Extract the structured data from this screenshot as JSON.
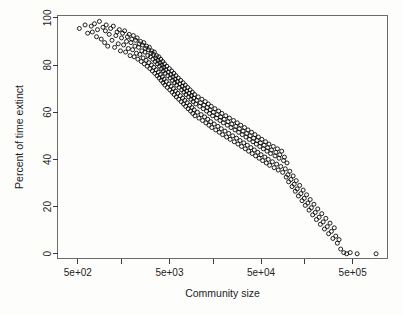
{
  "figure": {
    "background_color": "#fdfdfc",
    "point_color": "#0a0a0a",
    "axis_color": "#3a3a3a",
    "box_color": "#6b6b6b"
  },
  "chart_data": {
    "type": "scatter",
    "title": "",
    "subtitle": "",
    "xlabel": "Community size",
    "ylabel": "Percent of time extinct",
    "xscale": "log",
    "yscale": "linear",
    "xlim": [
      300,
      1200000
    ],
    "ylim": [
      -2,
      101
    ],
    "grid": false,
    "legend": null,
    "marker": "open-circle",
    "marker_size": 4,
    "x_major_ticks": [
      500,
      5000,
      50000,
      500000
    ],
    "x_major_tick_labels": [
      "5e+02",
      "5e+03",
      "5e+04",
      "5e+05"
    ],
    "x_minor_ticks": [
      1500,
      15000,
      150000,
      1500000
    ],
    "y_ticks": [
      0,
      20,
      40,
      60,
      80,
      100
    ],
    "y_tick_labels": [
      "0",
      "20",
      "40",
      "60",
      "80",
      "100"
    ],
    "n_points": 640,
    "points": [
      [
        520,
        95.5
      ],
      [
        600,
        97.0
      ],
      [
        640,
        93.5
      ],
      [
        700,
        96.5
      ],
      [
        720,
        94.0
      ],
      [
        760,
        97.5
      ],
      [
        800,
        92.0
      ],
      [
        820,
        95.0
      ],
      [
        860,
        98.5
      ],
      [
        900,
        91.0
      ],
      [
        940,
        96.0
      ],
      [
        980,
        89.5
      ],
      [
        1000,
        94.5
      ],
      [
        1020,
        97.0
      ],
      [
        1060,
        88.0
      ],
      [
        1100,
        93.0
      ],
      [
        1140,
        95.5
      ],
      [
        1180,
        90.5
      ],
      [
        1220,
        96.5
      ],
      [
        1260,
        87.5
      ],
      [
        1300,
        92.5
      ],
      [
        1340,
        94.0
      ],
      [
        1380,
        89.0
      ],
      [
        1420,
        95.0
      ],
      [
        1460,
        86.0
      ],
      [
        1500,
        91.5
      ],
      [
        1540,
        93.5
      ],
      [
        1580,
        88.5
      ],
      [
        1620,
        94.5
      ],
      [
        1660,
        85.5
      ],
      [
        1700,
        90.0
      ],
      [
        1740,
        92.0
      ],
      [
        1780,
        87.0
      ],
      [
        1820,
        93.0
      ],
      [
        1860,
        84.0
      ],
      [
        1900,
        89.5
      ],
      [
        1940,
        91.0
      ],
      [
        1980,
        86.5
      ],
      [
        2020,
        92.5
      ],
      [
        2060,
        83.5
      ],
      [
        2100,
        88.0
      ],
      [
        2140,
        90.5
      ],
      [
        2180,
        85.0
      ],
      [
        2220,
        91.5
      ],
      [
        2260,
        82.5
      ],
      [
        2300,
        87.5
      ],
      [
        2340,
        89.0
      ],
      [
        2380,
        84.5
      ],
      [
        2420,
        90.0
      ],
      [
        2460,
        81.5
      ],
      [
        2500,
        86.0
      ],
      [
        2540,
        88.5
      ],
      [
        2580,
        83.0
      ],
      [
        2620,
        89.5
      ],
      [
        2660,
        80.5
      ],
      [
        2700,
        85.5
      ],
      [
        2740,
        87.0
      ],
      [
        2780,
        82.0
      ],
      [
        2820,
        88.0
      ],
      [
        2860,
        79.5
      ],
      [
        2900,
        84.0
      ],
      [
        2940,
        86.5
      ],
      [
        2980,
        81.0
      ],
      [
        3020,
        87.5
      ],
      [
        3060,
        78.5
      ],
      [
        3100,
        83.5
      ],
      [
        3140,
        85.0
      ],
      [
        3180,
        80.0
      ],
      [
        3220,
        86.0
      ],
      [
        3260,
        77.5
      ],
      [
        3300,
        82.5
      ],
      [
        3340,
        84.5
      ],
      [
        3380,
        79.0
      ],
      [
        3420,
        85.5
      ],
      [
        3460,
        76.5
      ],
      [
        3500,
        81.5
      ],
      [
        3540,
        83.0
      ],
      [
        3580,
        78.0
      ],
      [
        3620,
        84.0
      ],
      [
        3660,
        75.5
      ],
      [
        3700,
        80.5
      ],
      [
        3740,
        82.0
      ],
      [
        3780,
        77.0
      ],
      [
        3820,
        83.5
      ],
      [
        3860,
        74.5
      ],
      [
        3900,
        79.5
      ],
      [
        3940,
        81.0
      ],
      [
        3980,
        76.0
      ],
      [
        4020,
        82.5
      ],
      [
        4060,
        73.5
      ],
      [
        4100,
        78.5
      ],
      [
        4140,
        80.0
      ],
      [
        4180,
        75.0
      ],
      [
        4220,
        81.5
      ],
      [
        4260,
        72.5
      ],
      [
        4300,
        77.5
      ],
      [
        4340,
        79.0
      ],
      [
        4380,
        74.0
      ],
      [
        4420,
        80.5
      ],
      [
        4460,
        71.5
      ],
      [
        4500,
        76.5
      ],
      [
        4560,
        78.0
      ],
      [
        4620,
        73.0
      ],
      [
        4680,
        79.5
      ],
      [
        4740,
        70.5
      ],
      [
        4800,
        75.5
      ],
      [
        4860,
        77.0
      ],
      [
        4920,
        72.0
      ],
      [
        4980,
        78.5
      ],
      [
        5040,
        69.5
      ],
      [
        5100,
        74.5
      ],
      [
        5160,
        76.0
      ],
      [
        5220,
        71.0
      ],
      [
        5280,
        77.5
      ],
      [
        5340,
        68.5
      ],
      [
        5400,
        73.5
      ],
      [
        5460,
        75.0
      ],
      [
        5520,
        70.0
      ],
      [
        5580,
        76.5
      ],
      [
        5640,
        67.5
      ],
      [
        5700,
        72.5
      ],
      [
        5760,
        74.0
      ],
      [
        5820,
        69.0
      ],
      [
        5880,
        75.5
      ],
      [
        5940,
        66.5
      ],
      [
        6000,
        71.5
      ],
      [
        6080,
        73.0
      ],
      [
        6160,
        68.0
      ],
      [
        6240,
        74.5
      ],
      [
        6320,
        65.5
      ],
      [
        6400,
        70.5
      ],
      [
        6480,
        72.0
      ],
      [
        6560,
        67.0
      ],
      [
        6640,
        73.5
      ],
      [
        6720,
        64.5
      ],
      [
        6800,
        69.5
      ],
      [
        6880,
        71.0
      ],
      [
        6960,
        66.0
      ],
      [
        7040,
        72.5
      ],
      [
        7120,
        63.5
      ],
      [
        7200,
        68.5
      ],
      [
        7280,
        70.0
      ],
      [
        7360,
        65.0
      ],
      [
        7440,
        71.5
      ],
      [
        7520,
        62.5
      ],
      [
        7600,
        67.5
      ],
      [
        7700,
        69.0
      ],
      [
        7800,
        64.0
      ],
      [
        7900,
        70.5
      ],
      [
        8000,
        61.5
      ],
      [
        8100,
        66.5
      ],
      [
        8200,
        68.0
      ],
      [
        8300,
        63.0
      ],
      [
        8400,
        69.5
      ],
      [
        8500,
        60.5
      ],
      [
        8600,
        65.5
      ],
      [
        8700,
        67.0
      ],
      [
        8800,
        62.0
      ],
      [
        8900,
        68.5
      ],
      [
        9000,
        59.5
      ],
      [
        9100,
        64.5
      ],
      [
        9200,
        66.0
      ],
      [
        9300,
        61.0
      ],
      [
        9400,
        67.5
      ],
      [
        9500,
        58.5
      ],
      [
        9700,
        63.5
      ],
      [
        9900,
        65.0
      ],
      [
        10100,
        60.0
      ],
      [
        10300,
        66.5
      ],
      [
        10500,
        57.5
      ],
      [
        10700,
        62.5
      ],
      [
        10900,
        64.0
      ],
      [
        11100,
        59.0
      ],
      [
        11300,
        65.5
      ],
      [
        11500,
        56.5
      ],
      [
        11700,
        61.5
      ],
      [
        11900,
        63.0
      ],
      [
        12100,
        58.0
      ],
      [
        12300,
        64.5
      ],
      [
        12500,
        55.5
      ],
      [
        12700,
        60.5
      ],
      [
        12900,
        62.0
      ],
      [
        13100,
        57.0
      ],
      [
        13300,
        63.5
      ],
      [
        13500,
        54.5
      ],
      [
        13700,
        59.5
      ],
      [
        13900,
        61.0
      ],
      [
        14100,
        56.0
      ],
      [
        14300,
        62.5
      ],
      [
        14500,
        53.5
      ],
      [
        14800,
        58.5
      ],
      [
        15100,
        60.0
      ],
      [
        15400,
        55.0
      ],
      [
        15700,
        61.5
      ],
      [
        16000,
        52.5
      ],
      [
        16300,
        57.5
      ],
      [
        16600,
        59.0
      ],
      [
        16900,
        54.0
      ],
      [
        17200,
        60.5
      ],
      [
        17500,
        51.5
      ],
      [
        17800,
        56.5
      ],
      [
        18100,
        58.0
      ],
      [
        18400,
        53.0
      ],
      [
        18700,
        59.5
      ],
      [
        19000,
        50.5
      ],
      [
        19400,
        55.5
      ],
      [
        19800,
        57.0
      ],
      [
        20200,
        52.0
      ],
      [
        20600,
        58.5
      ],
      [
        21000,
        49.5
      ],
      [
        21400,
        54.5
      ],
      [
        21800,
        56.0
      ],
      [
        22200,
        51.0
      ],
      [
        22600,
        57.5
      ],
      [
        23000,
        48.5
      ],
      [
        23500,
        53.5
      ],
      [
        24000,
        55.0
      ],
      [
        24500,
        50.0
      ],
      [
        25000,
        56.5
      ],
      [
        25500,
        47.5
      ],
      [
        26000,
        52.5
      ],
      [
        26500,
        54.0
      ],
      [
        27000,
        49.0
      ],
      [
        27500,
        55.5
      ],
      [
        28000,
        46.5
      ],
      [
        28500,
        51.5
      ],
      [
        29000,
        53.0
      ],
      [
        29500,
        48.0
      ],
      [
        30000,
        54.5
      ],
      [
        30600,
        45.5
      ],
      [
        31200,
        50.5
      ],
      [
        31800,
        52.0
      ],
      [
        32400,
        47.0
      ],
      [
        33000,
        53.5
      ],
      [
        33600,
        44.5
      ],
      [
        34200,
        49.5
      ],
      [
        34800,
        51.0
      ],
      [
        35400,
        46.0
      ],
      [
        36000,
        52.5
      ],
      [
        36600,
        43.5
      ],
      [
        37300,
        48.5
      ],
      [
        38000,
        50.0
      ],
      [
        38700,
        45.0
      ],
      [
        39400,
        51.5
      ],
      [
        40100,
        42.5
      ],
      [
        40800,
        47.5
      ],
      [
        41500,
        49.0
      ],
      [
        42200,
        44.0
      ],
      [
        42900,
        50.5
      ],
      [
        43600,
        41.5
      ],
      [
        44400,
        46.5
      ],
      [
        45200,
        48.0
      ],
      [
        46000,
        43.0
      ],
      [
        46800,
        49.5
      ],
      [
        47600,
        40.5
      ],
      [
        48400,
        45.5
      ],
      [
        49200,
        47.0
      ],
      [
        50000,
        42.0
      ],
      [
        51000,
        48.5
      ],
      [
        52000,
        39.5
      ],
      [
        53000,
        44.5
      ],
      [
        54000,
        46.0
      ],
      [
        55000,
        41.0
      ],
      [
        56000,
        47.5
      ],
      [
        57000,
        38.5
      ],
      [
        58000,
        43.5
      ],
      [
        59000,
        45.0
      ],
      [
        60000,
        40.0
      ],
      [
        61000,
        46.5
      ],
      [
        62000,
        37.5
      ],
      [
        63500,
        42.5
      ],
      [
        65000,
        44.0
      ],
      [
        66500,
        39.0
      ],
      [
        68000,
        45.5
      ],
      [
        69500,
        36.5
      ],
      [
        71000,
        41.5
      ],
      [
        72500,
        43.0
      ],
      [
        74000,
        38.0
      ],
      [
        75500,
        44.5
      ],
      [
        77000,
        35.5
      ],
      [
        78500,
        40.5
      ],
      [
        80000,
        42.0
      ],
      [
        82000,
        37.0
      ],
      [
        84000,
        43.5
      ],
      [
        86000,
        34.5
      ],
      [
        88000,
        39.5
      ],
      [
        90000,
        41.0
      ],
      [
        92000,
        36.0
      ],
      [
        94000,
        32.5
      ],
      [
        96000,
        38.5
      ],
      [
        98000,
        33.5
      ],
      [
        100000,
        30.5
      ],
      [
        103000,
        35.0
      ],
      [
        106000,
        31.5
      ],
      [
        109000,
        28.5
      ],
      [
        112000,
        33.0
      ],
      [
        115000,
        29.5
      ],
      [
        118000,
        26.5
      ],
      [
        121000,
        31.0
      ],
      [
        124000,
        27.5
      ],
      [
        128000,
        24.5
      ],
      [
        132000,
        29.0
      ],
      [
        136000,
        25.5
      ],
      [
        140000,
        22.5
      ],
      [
        144000,
        27.0
      ],
      [
        148000,
        23.5
      ],
      [
        152000,
        20.5
      ],
      [
        157000,
        25.0
      ],
      [
        162000,
        21.5
      ],
      [
        167000,
        18.5
      ],
      [
        172000,
        23.0
      ],
      [
        177000,
        19.5
      ],
      [
        183000,
        16.5
      ],
      [
        189000,
        21.0
      ],
      [
        195000,
        17.5
      ],
      [
        201000,
        14.5
      ],
      [
        208000,
        19.0
      ],
      [
        215000,
        15.5
      ],
      [
        222000,
        12.5
      ],
      [
        230000,
        17.0
      ],
      [
        238000,
        13.5
      ],
      [
        246000,
        10.5
      ],
      [
        255000,
        15.0
      ],
      [
        264000,
        11.5
      ],
      [
        273000,
        8.5
      ],
      [
        283000,
        13.0
      ],
      [
        293000,
        9.5
      ],
      [
        304000,
        6.5
      ],
      [
        315000,
        11.0
      ],
      [
        327000,
        7.5
      ],
      [
        340000,
        4.5
      ],
      [
        355000,
        6.0
      ],
      [
        370000,
        2.0
      ],
      [
        400000,
        0.5
      ],
      [
        430000,
        0.0
      ],
      [
        470000,
        0.5
      ],
      [
        560000,
        0.0
      ],
      [
        900000,
        0.0
      ]
    ]
  },
  "axes": {
    "x_title": "Community size",
    "y_title": "Percent of time extinct",
    "x_tick_labels": [
      "5e+02",
      "5e+03",
      "5e+04",
      "5e+05"
    ],
    "y_tick_labels": [
      "100",
      "80",
      "60",
      "40",
      "20",
      "0"
    ]
  }
}
